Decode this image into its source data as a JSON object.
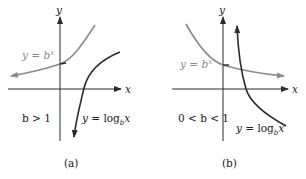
{
  "colors": {
    "axis": "#2a2a2a",
    "exp_curve": "#8a8a8a",
    "log_curve": "#2a2a2a",
    "exp_label": "#8a8a8a",
    "text": "#222222"
  },
  "panels": [
    {
      "id": "a",
      "caption": "(a)",
      "condition": "b > 1",
      "axis_labels": {
        "x": "x",
        "y": "y"
      },
      "exp_label": {
        "lhs": "y = ",
        "base": "b",
        "exp": "x"
      },
      "log_label": {
        "lhs": "y = log",
        "sub": "b",
        "arg": "x"
      }
    },
    {
      "id": "b",
      "caption": "(b)",
      "condition": "0 < b < 1",
      "axis_labels": {
        "x": "x",
        "y": "y"
      },
      "exp_label": {
        "lhs": "y = ",
        "base": "b",
        "exp": "x"
      },
      "log_label": {
        "lhs": "y = log",
        "sub": "b",
        "arg": "x"
      }
    }
  ]
}
